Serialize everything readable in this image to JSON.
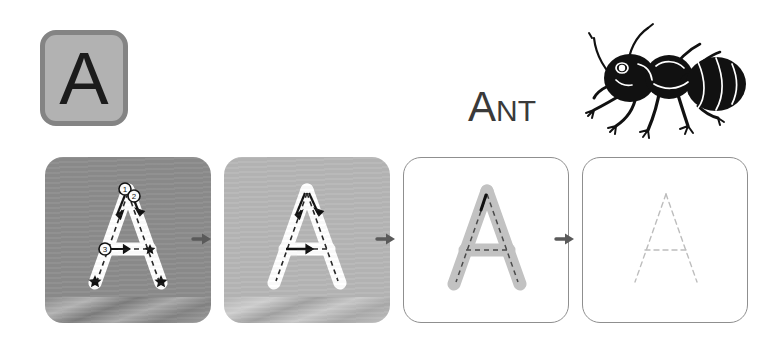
{
  "worksheet": {
    "letter": "A",
    "letter_case": "uppercase",
    "word": {
      "full": "ANT",
      "initial": "A",
      "rest": "NT"
    },
    "illustration": {
      "name": "ant-illustration",
      "subject": "ant",
      "color": "#111111"
    },
    "colors": {
      "tile_fill": "#b2b2b2",
      "tile_border": "#848484",
      "letter_ink": "#1b1b1b",
      "box1_bg": "#8c8c8c",
      "box2_bg": "#b6b6b6",
      "box3_bg": "#ffffff",
      "box4_bg": "#ffffff",
      "box_border": "#8f8f8f",
      "trace_white": "#ffffff",
      "trace_gray": "#c2c2c2",
      "guide_dash": "#2b2b2b",
      "guide_dash_faint": "#b9b9b9",
      "arrow": "#5a5a5a",
      "word_ink": "#3a3a3a"
    },
    "steps": [
      {
        "index": 1,
        "name": "traced-model-with-numbers",
        "box_label": "Step 1",
        "background": "dark-gray",
        "letter_fill": "white",
        "guides": "dashed",
        "shows_stroke_numbers": true,
        "shows_direction_arrows": true,
        "shows_end_stars": true,
        "stroke_numbers": [
          "1",
          "2",
          "3"
        ]
      },
      {
        "index": 2,
        "name": "traced-model-with-arrows",
        "box_label": "Step 2",
        "background": "light-gray",
        "letter_fill": "white",
        "guides": "dashed",
        "shows_stroke_numbers": false,
        "shows_direction_arrows": true,
        "shows_end_stars": false,
        "stroke_numbers": []
      },
      {
        "index": 3,
        "name": "gray-trace-letter",
        "box_label": "Step 3",
        "background": "white",
        "letter_fill": "gray",
        "guides": "dashed",
        "shows_stroke_numbers": false,
        "shows_direction_arrows": false,
        "shows_end_stars": false,
        "stroke_numbers": []
      },
      {
        "index": 4,
        "name": "dotted-outline-only",
        "box_label": "Step 4",
        "background": "white",
        "letter_fill": "none",
        "guides": "dotted-faint",
        "shows_stroke_numbers": false,
        "shows_direction_arrows": false,
        "shows_end_stars": false,
        "stroke_numbers": []
      }
    ],
    "arrows": [
      {
        "name": "step-arrow-1-to-2",
        "direction": "right"
      },
      {
        "name": "step-arrow-2-to-3",
        "direction": "right"
      },
      {
        "name": "step-arrow-3-to-4",
        "direction": "right"
      }
    ]
  }
}
